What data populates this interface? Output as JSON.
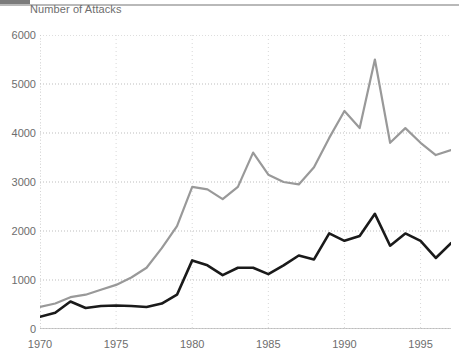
{
  "header": {
    "title": "Number of Attacks",
    "toolbar_block": "toolbar-swatch"
  },
  "chart_data": {
    "type": "line",
    "title": "Number of Attacks",
    "xlabel": "",
    "ylabel": "Number of Attacks",
    "xlim": [
      1970,
      1997
    ],
    "ylim": [
      0,
      6000
    ],
    "grid": true,
    "legend": "none",
    "y_ticks": [
      0,
      1000,
      2000,
      3000,
      4000,
      5000,
      6000
    ],
    "y_tick_labels": [
      "0",
      "1000",
      "2000",
      "3000",
      "4000",
      "5000",
      "6000"
    ],
    "x_ticks": [
      1970,
      1975,
      1980,
      1985,
      1990,
      1995
    ],
    "x_tick_labels": [
      "1970",
      "1975",
      "1980",
      "1985",
      "1990",
      "1995"
    ],
    "x_minor_tick_step": 1,
    "x": [
      1970,
      1971,
      1972,
      1973,
      1974,
      1975,
      1976,
      1977,
      1978,
      1979,
      1980,
      1981,
      1982,
      1983,
      1984,
      1985,
      1986,
      1987,
      1988,
      1989,
      1990,
      1991,
      1992,
      1993,
      1994,
      1995,
      1996,
      1997
    ],
    "series": [
      {
        "name": "total-attacks",
        "color": "#999999",
        "width": 2.2,
        "values": [
          450,
          520,
          650,
          700,
          800,
          900,
          1050,
          1250,
          1650,
          2100,
          2900,
          2850,
          2650,
          2900,
          3600,
          3150,
          3000,
          2950,
          3300,
          3900,
          4450,
          4100,
          5500,
          3800,
          4100,
          3800,
          3550,
          3650
        ]
      },
      {
        "name": "lethal-attacks",
        "color": "#1a1a1a",
        "width": 2.6,
        "values": [
          250,
          330,
          560,
          430,
          470,
          480,
          470,
          450,
          520,
          700,
          1400,
          1300,
          1100,
          1250,
          1250,
          1120,
          1300,
          1500,
          1420,
          1950,
          1800,
          1900,
          2350,
          1700,
          1950,
          1800,
          1450,
          1750
        ]
      }
    ]
  }
}
